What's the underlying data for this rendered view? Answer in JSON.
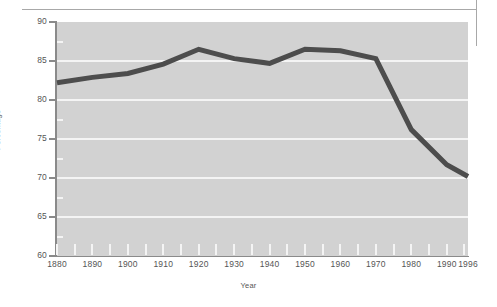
{
  "chart_data": {
    "type": "line",
    "title": "",
    "xlabel": "Year",
    "ylabel": "Percentage",
    "xlim": [
      1880,
      1996
    ],
    "ylim": [
      60,
      90
    ],
    "grid": true,
    "legend": "none",
    "x_ticks": [
      1880,
      1890,
      1900,
      1910,
      1920,
      1930,
      1940,
      1950,
      1960,
      1970,
      1980,
      1990,
      1996
    ],
    "x_tick_labels": [
      "1880",
      "1890",
      "1900",
      "1910",
      "1920",
      "1930",
      "1940",
      "1950",
      "1960",
      "1970",
      "1980",
      "1990",
      "1996"
    ],
    "x_minor_tick_step": 5,
    "y_ticks": [
      60,
      65,
      70,
      75,
      80,
      85,
      90
    ],
    "y_tick_labels": [
      "60",
      "65",
      "70",
      "75",
      "80",
      "85",
      "90"
    ],
    "y_minor_ticks": [
      62.5,
      67.5,
      72.5,
      77.5,
      82.5,
      87.5
    ],
    "gridline_values": [
      65,
      70,
      75,
      80,
      85
    ],
    "series": [
      {
        "name": "Percentage",
        "color": "#4d4d4d",
        "line_width": 5,
        "x": [
          1880,
          1890,
          1900,
          1910,
          1920,
          1930,
          1940,
          1950,
          1960,
          1970,
          1980,
          1990,
          1996
        ],
        "values": [
          82.2,
          82.9,
          83.4,
          84.6,
          86.5,
          85.3,
          84.7,
          86.5,
          86.3,
          85.3,
          76.2,
          71.7,
          70.2
        ]
      }
    ]
  },
  "decoration": {
    "top_rule_color": "#a8a8a8",
    "right_rule_color": "#a8a8a8",
    "plot_background": "#d2d2d2",
    "gridline_color": "#f4f4f4",
    "axis_color": "#8a8a8a",
    "text_color": "#555555"
  }
}
